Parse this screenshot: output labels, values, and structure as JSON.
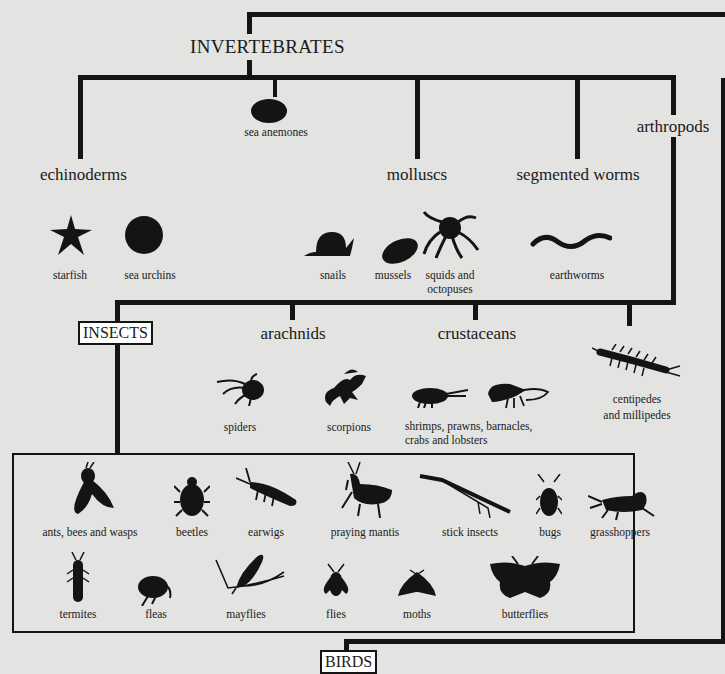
{
  "title": "INVERTEBRATES",
  "groups": {
    "sea_anemones": "sea anemones",
    "echinoderms": "echinoderms",
    "molluscs": "molluscs",
    "segmented_worms": "segmented worms",
    "arthropods": "arthropods",
    "insects": "INSECTS",
    "arachnids": "arachnids",
    "crustaceans": "crustaceans",
    "birds": "BIRDS"
  },
  "echinoderms": [
    "starfish",
    "sea urchins"
  ],
  "molluscs": [
    "snails",
    "mussels",
    "squids and",
    "octopuses"
  ],
  "segmented_worms": [
    "earthworms"
  ],
  "arachnids": [
    "spiders",
    "scorpions"
  ],
  "crustaceans": [
    "shrimps, prawns, barnacles,",
    "crabs and lobsters"
  ],
  "myriapods": [
    "centipedes",
    "and millipedes"
  ],
  "insects_row1": [
    "ants, bees and wasps",
    "beetles",
    "earwigs",
    "praying mantis",
    "stick insects",
    "bugs",
    "grasshoppers"
  ],
  "insects_row2": [
    "termites",
    "fleas",
    "mayflies",
    "flies",
    "moths",
    "butterflies"
  ],
  "colors": {
    "background": "#e3e3e1",
    "line": "#141414"
  }
}
